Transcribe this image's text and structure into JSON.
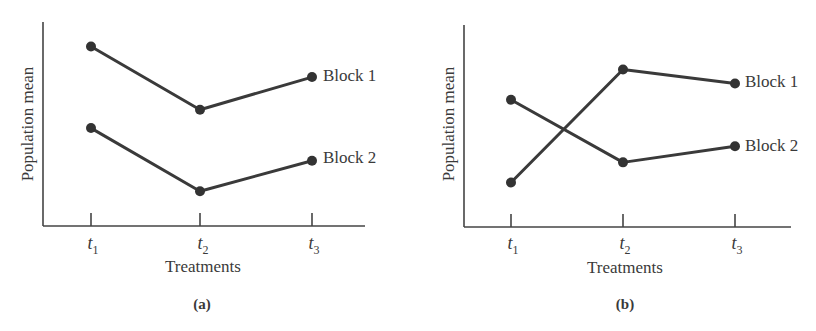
{
  "chart_data": [
    {
      "type": "line",
      "panel_label": "(a)",
      "title": "",
      "xlabel": "Treatments",
      "ylabel": "Population mean",
      "categories": [
        "t1",
        "t2",
        "t3"
      ],
      "category_display": [
        {
          "base": "t",
          "sub": "1"
        },
        {
          "base": "t",
          "sub": "2"
        },
        {
          "base": "t",
          "sub": "3"
        }
      ],
      "series": [
        {
          "name": "Block 1",
          "values": [
            8.8,
            5.7,
            7.3
          ]
        },
        {
          "name": "Block 2",
          "values": [
            4.8,
            1.7,
            3.2
          ]
        }
      ],
      "ylim": [
        0,
        10
      ],
      "grid": false,
      "y_ticks_shown": false,
      "legend": "direct labels at right end of each line"
    },
    {
      "type": "line",
      "panel_label": "(b)",
      "title": "",
      "xlabel": "Treatments",
      "ylabel": "Population mean",
      "categories": [
        "t1",
        "t2",
        "t3"
      ],
      "category_display": [
        {
          "base": "t",
          "sub": "1"
        },
        {
          "base": "t",
          "sub": "2"
        },
        {
          "base": "t",
          "sub": "3"
        }
      ],
      "series": [
        {
          "name": "Block 1",
          "values": [
            2.2,
            7.8,
            7.1
          ]
        },
        {
          "name": "Block 2",
          "values": [
            6.3,
            3.2,
            4.0
          ]
        }
      ],
      "ylim": [
        0,
        10
      ],
      "grid": false,
      "y_ticks_shown": false,
      "legend": "direct labels at right end of each line"
    }
  ],
  "layout": {
    "panels": [
      {
        "axis_x": 43,
        "axis_top": 22,
        "axis_bottom": 226,
        "axis_right": 365,
        "tick_x": [
          91,
          200,
          312
        ]
      },
      {
        "axis_x": 464,
        "axis_top": 25,
        "axis_bottom": 227,
        "axis_right": 791,
        "tick_x": [
          511,
          623,
          735
        ]
      }
    ]
  }
}
